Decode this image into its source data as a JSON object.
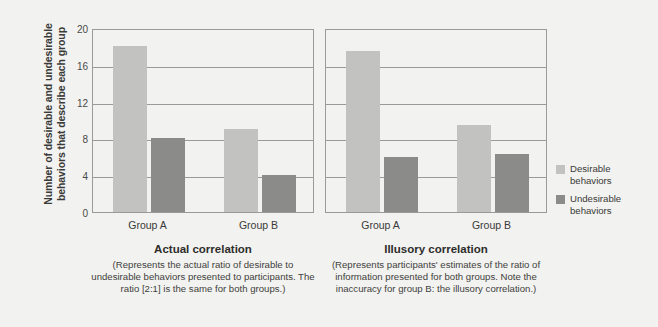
{
  "chart_data": {
    "type": "bar",
    "title": "",
    "ylabel": "Number of desirable and undesirable behaviors that describe each group",
    "xlabel": "",
    "ylim": [
      0,
      20
    ],
    "yticks": [
      0,
      4,
      8,
      12,
      16,
      20
    ],
    "grid": true,
    "legend_position": "right",
    "categories": [
      "Group A",
      "Group B"
    ],
    "panels": [
      {
        "id": "actual",
        "title": "Actual correlation",
        "note": "(Represents the actual ratio of desirable to undesirable behaviors presented to participants. The ratio [2:1] is the same for both groups.)",
        "categories": [
          "Group A",
          "Group B"
        ],
        "series": [
          {
            "name": "Desirable behaviors",
            "values": [
              18,
              9
            ]
          },
          {
            "name": "Undesirable behaviors",
            "values": [
              8,
              4
            ]
          }
        ]
      },
      {
        "id": "illusory",
        "title": "Illusory correlation",
        "note": "(Represents participants' estimates of the ratio of information presented for both groups. Note the inaccuracy for group B: the illusory correlation.)",
        "categories": [
          "Group A",
          "Group B"
        ],
        "series": [
          {
            "name": "Desirable behaviors",
            "values": [
              17.5,
              9.5
            ]
          },
          {
            "name": "Undesirable behaviors",
            "values": [
              6,
              6.3
            ]
          }
        ]
      }
    ],
    "legend": [
      {
        "name": "Desirable behaviors",
        "line1": "Desirable",
        "line2": "behaviors",
        "color": "#c2c2c0"
      },
      {
        "name": "Undesirable behaviors",
        "line1": "Undesirable",
        "line2": "behaviors",
        "color": "#8b8b89"
      }
    ],
    "colors": {
      "desirable": "#c2c2c0",
      "undesirable": "#8b8b89",
      "axis": "#9a9a98",
      "background": "#f2f2f0"
    }
  }
}
